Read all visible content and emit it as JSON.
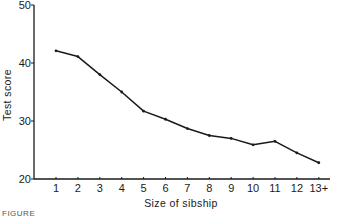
{
  "chart_data": {
    "type": "line",
    "title": "",
    "xlabel": "Size of sibship",
    "ylabel": "Test score",
    "categories": [
      "1",
      "2",
      "3",
      "4",
      "5",
      "6",
      "7",
      "8",
      "9",
      "10",
      "11",
      "12",
      "13+"
    ],
    "series": [
      {
        "name": "Test score",
        "values": [
          42.1,
          41.1,
          38.0,
          35.0,
          31.7,
          30.3,
          28.7,
          27.5,
          27.0,
          25.9,
          26.5,
          24.5,
          22.8
        ]
      }
    ],
    "ylim": [
      20,
      50
    ],
    "yticks": [
      20,
      30,
      40,
      50
    ],
    "grid": false,
    "legend": "none",
    "line_color": "#1a1a1a"
  },
  "caption": "FIGURE"
}
